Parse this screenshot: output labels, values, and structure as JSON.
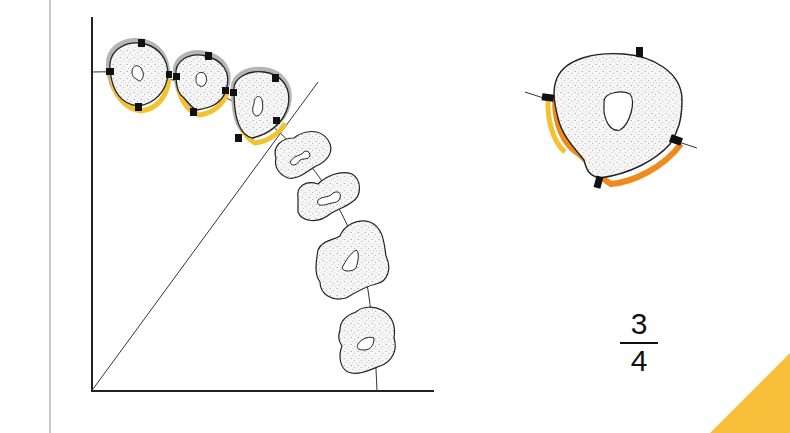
{
  "figure": {
    "fraction": {
      "numerator": "3",
      "denominator": "4"
    },
    "colors": {
      "outline": "#222222",
      "stipple": "#9a9a9a",
      "gray_surface": "#b5b5b5",
      "yellow_surface": "#f2c230",
      "orange_surface": "#f08a1a",
      "corner_accent": "#f8c03a",
      "page_rule": "#c8c8c8"
    },
    "elements": {
      "axes": "right-angle axes (vertical and horizontal)",
      "diagonal": "diagonal line from origin",
      "arch_curve": "curved arch line through tooth sections",
      "tooth_sections_highlighted": 3,
      "tooth_sections_plain": 4,
      "enlarged_detail": "single enlarged tooth cross-section with markers"
    }
  }
}
